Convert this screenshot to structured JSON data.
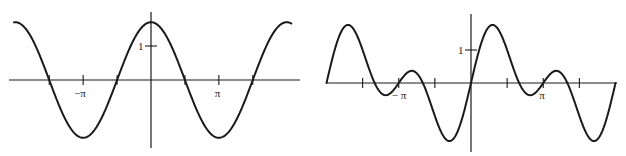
{
  "chart_data": [
    {
      "type": "line",
      "title": "",
      "function": "y = 1.7 cos(x)",
      "xlabel": "",
      "ylabel": "",
      "xlim": [
        -6.35,
        6.5
      ],
      "ylim": [
        -1.9,
        1.9
      ],
      "grid": false,
      "x_ticks": [
        -4.712,
        -3.1416,
        -1.5708,
        1.5708,
        3.1416,
        4.712
      ],
      "x_tick_labels": [
        "",
        "−π",
        "",
        "",
        "π",
        ""
      ],
      "y_ticks": [
        1
      ],
      "y_tick_labels": [
        "1"
      ],
      "series": [
        {
          "name": "curve",
          "amplitude": 1.7,
          "period": 6.2832,
          "x": [
            -6.28,
            -4.71,
            -3.14,
            -1.57,
            0,
            1.57,
            3.14,
            4.71,
            6.28
          ],
          "values": [
            1.7,
            0,
            -1.7,
            0,
            1.7,
            0,
            -1.7,
            0,
            1.7
          ]
        }
      ],
      "geometry": {
        "origin_x": 151,
        "origin_y": 80,
        "px_per_unit_x": 21.6,
        "px_per_unit_y": 34,
        "axis_x_from": 9,
        "axis_x_to": 300,
        "axis_y_from": 12,
        "axis_y_to": 148,
        "curve_x_from": -6.34,
        "curve_x_to": 6.5
      }
    },
    {
      "type": "line",
      "title": "",
      "function": "y = sin(x) + sin(2x)",
      "xlabel": "",
      "ylabel": "",
      "xlim": [
        -6.2832,
        6.2832
      ],
      "ylim": [
        -1.9,
        1.9
      ],
      "grid": false,
      "x_ticks": [
        -4.712,
        -3.1416,
        -1.5708,
        1.5708,
        3.1416,
        4.712
      ],
      "x_tick_labels": [
        "",
        "−π",
        "",
        "",
        "π",
        ""
      ],
      "y_ticks": [
        1
      ],
      "y_tick_labels": [
        "1"
      ],
      "series": [
        {
          "name": "curve",
          "x": [
            -6.28,
            -5.34,
            -3.14,
            -2.5,
            -0.94,
            0,
            0.94,
            2.5,
            3.14,
            3.78,
            5.34,
            6.28
          ],
          "values": [
            0,
            1.76,
            0,
            -0.37,
            -1.76,
            0,
            1.76,
            -0.37,
            0,
            0.37,
            -1.76,
            0
          ]
        }
      ],
      "geometry": {
        "origin_x": 471,
        "origin_y": 83,
        "px_per_unit_x": 23,
        "px_per_unit_y": 33,
        "axis_x_from": 327,
        "axis_x_to": 617,
        "axis_y_from": 14,
        "axis_y_to": 152,
        "curve_x_from": -6.2832,
        "curve_x_to": 6.2832
      }
    }
  ],
  "labels": {
    "left": {
      "neg_pi": "−π",
      "pi": "π",
      "one": "1"
    },
    "right": {
      "neg_pi": "− π",
      "pi": "π",
      "one": "1"
    }
  }
}
